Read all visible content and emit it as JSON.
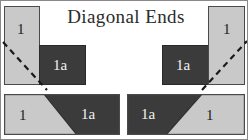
{
  "figure": {
    "title": "Diagonal Ends",
    "width": 248,
    "height": 140,
    "colors": {
      "light_fill": "#c9c9c9",
      "dark_fill": "#3b3b3b",
      "outline": "#4a4a4a",
      "background": "#ffffff",
      "label_on_light": "#1d1d1d",
      "label_on_dark": "#f2f2f2",
      "dash_line": "#1a1a1a"
    }
  },
  "panels": [
    {
      "id": "top-left",
      "description": "L-shaped butt joint, vertical light member over horizontal dark member, with dashed diagonal cut line",
      "light_label": "1",
      "dark_label": "1a",
      "dashed_line": true
    },
    {
      "id": "top-right",
      "description": "Mirrored L-shaped butt joint, vertical light member right, horizontal dark member left, with dashed diagonal cut line",
      "light_label": "1",
      "dark_label": "1a",
      "dashed_line": true
    },
    {
      "id": "bottom-left",
      "description": "Assembled bar with diagonal mitre, light part left, dark part right",
      "light_label": "1",
      "dark_label": "1a",
      "dashed_line": false
    },
    {
      "id": "bottom-right",
      "description": "Assembled bar with diagonal mitre, dark part left, light part right",
      "dark_label": "1a",
      "light_label": "1",
      "dashed_line": false
    }
  ]
}
